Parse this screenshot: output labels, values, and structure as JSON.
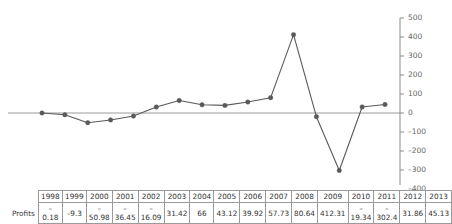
{
  "chart_data": {
    "type": "line",
    "title": "",
    "xlabel": "",
    "ylabel": "",
    "categories": [
      "1998",
      "1999",
      "2000",
      "2001",
      "2002",
      "2003",
      "2004",
      "2005",
      "2006",
      "2007",
      "2008",
      "2009",
      "2010",
      "2011",
      "2012",
      "2013"
    ],
    "series": [
      {
        "name": "Profits",
        "values": [
          -0.18,
          -9.3,
          -50.98,
          -36.45,
          -16.09,
          31.42,
          66,
          43.12,
          39.92,
          57.73,
          80.64,
          412.31,
          -19.34,
          -302.4,
          31.86,
          45.13
        ]
      }
    ],
    "ylim": [
      -400,
      500
    ],
    "yticks": [
      500,
      400,
      300,
      200,
      100,
      0,
      -100,
      -200,
      -300,
      -400
    ],
    "ytick_labels": [
      "500",
      "400",
      "300",
      "200",
      "100",
      "0",
      "–100",
      "–200",
      "–300",
      "–400"
    ],
    "grid": false,
    "legend": "none",
    "y_axis_position": "right",
    "zero_line": true,
    "marker": "circle",
    "line_color": "#595959",
    "marker_color": "#595959",
    "axis_color": "#808080"
  },
  "table": {
    "row_label": "Profits",
    "headers": [
      "1998",
      "1999",
      "2000",
      "2001",
      "2002",
      "2003",
      "2004",
      "2005",
      "2006",
      "2007",
      "2008",
      "2009",
      "2010",
      "2011",
      "2012",
      "2013"
    ],
    "values": [
      "–0.18",
      "–9.3",
      "–50.98",
      "–36.45",
      "–16.09",
      "31.42",
      "66",
      "43.12",
      "39.92",
      "57.73",
      "80.64",
      "412.31",
      "–19.34",
      "–302.4",
      "31.86",
      "45.13"
    ]
  }
}
